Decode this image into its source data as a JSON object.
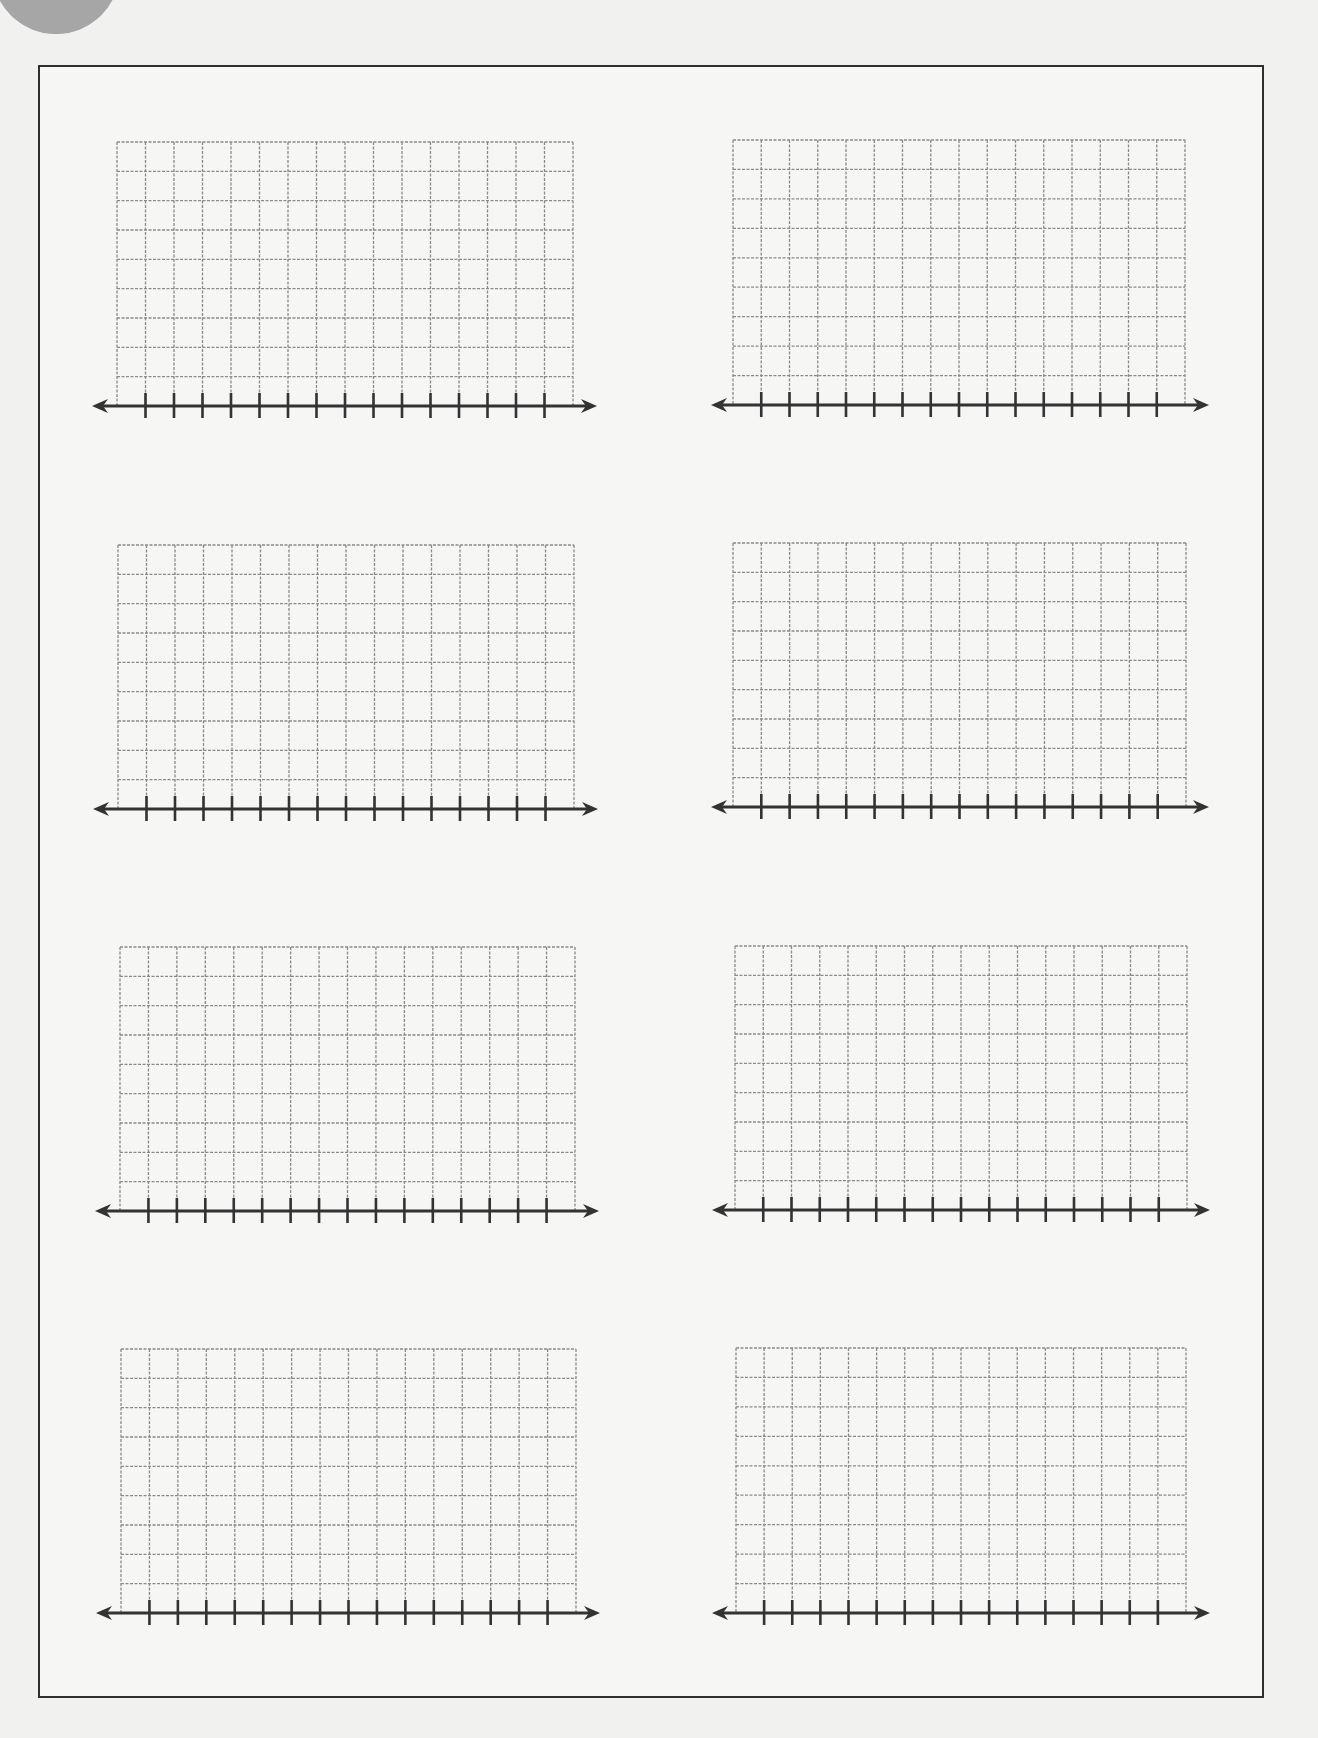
{
  "page": {
    "type": "blank line-plot / number-line grid worksheet",
    "background_color": "#f1f1f0",
    "frame_color": "#2f2f2f",
    "grid_line_color": "#8a8a8a",
    "axis_color": "#333333",
    "corner_circle_color": "#a6a6a6"
  },
  "layout": {
    "rows": 4,
    "columns": 2,
    "grid_columns_per_panel": 16,
    "grid_rows_per_panel": 9,
    "ticks_per_number_line": 15
  },
  "panels": [
    {
      "id": "panel-1",
      "x": 117,
      "y": 142,
      "w": 456,
      "h": 264,
      "axis_left": 93,
      "axis_right": 596
    },
    {
      "id": "panel-2",
      "x": 733,
      "y": 140,
      "w": 452,
      "h": 265,
      "axis_left": 712,
      "axis_right": 1208
    },
    {
      "id": "panel-3",
      "x": 118,
      "y": 545,
      "w": 456,
      "h": 264,
      "axis_left": 94,
      "axis_right": 597
    },
    {
      "id": "panel-4",
      "x": 733,
      "y": 543,
      "w": 453,
      "h": 264,
      "axis_left": 712,
      "axis_right": 1208
    },
    {
      "id": "panel-5",
      "x": 120,
      "y": 947,
      "w": 455,
      "h": 264,
      "axis_left": 96,
      "axis_right": 598
    },
    {
      "id": "panel-6",
      "x": 735,
      "y": 946,
      "w": 452,
      "h": 264,
      "axis_left": 713,
      "axis_right": 1209
    },
    {
      "id": "panel-7",
      "x": 121,
      "y": 1349,
      "w": 455,
      "h": 264,
      "axis_left": 97,
      "axis_right": 599
    },
    {
      "id": "panel-8",
      "x": 736,
      "y": 1348,
      "w": 450,
      "h": 265,
      "axis_left": 713,
      "axis_right": 1209
    }
  ]
}
